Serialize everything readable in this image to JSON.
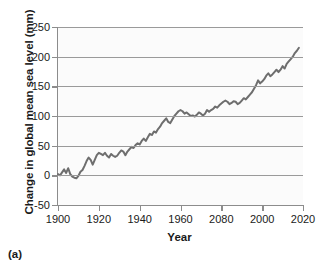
{
  "figure": {
    "caption": "(a)"
  },
  "chart_data": {
    "type": "line",
    "title": "",
    "xlabel": "Year",
    "ylabel": "Change in global mean sea level (mm)",
    "xlim": [
      1900,
      2020
    ],
    "ylim": [
      -50,
      250
    ],
    "xticks": [
      1900,
      1920,
      1940,
      1960,
      2080,
      2000,
      2020
    ],
    "xtick_positions": [
      1900,
      1920,
      1940,
      1960,
      1980,
      2000,
      2020
    ],
    "yticks": [
      250,
      200,
      150,
      100,
      50,
      0,
      -50
    ],
    "grid": "horizontal",
    "legend": "none",
    "line_color": "#6e6e6e",
    "line_width": 2.0,
    "zero_reference_line": {
      "value": 0,
      "style": "dashed",
      "color": "#9a9a9a"
    },
    "series": [
      {
        "name": "Change in global mean sea level",
        "units": "mm",
        "x": [
          1900,
          1901,
          1902,
          1903,
          1904,
          1905,
          1906,
          1907,
          1908,
          1909,
          1910,
          1911,
          1912,
          1913,
          1914,
          1915,
          1916,
          1917,
          1918,
          1919,
          1920,
          1921,
          1922,
          1923,
          1924,
          1925,
          1926,
          1927,
          1928,
          1929,
          1930,
          1931,
          1932,
          1933,
          1934,
          1935,
          1936,
          1937,
          1938,
          1939,
          1940,
          1941,
          1942,
          1943,
          1944,
          1945,
          1946,
          1947,
          1948,
          1949,
          1950,
          1951,
          1952,
          1953,
          1954,
          1955,
          1956,
          1957,
          1958,
          1959,
          1960,
          1961,
          1962,
          1963,
          1964,
          1965,
          1966,
          1967,
          1968,
          1969,
          1970,
          1971,
          1972,
          1973,
          1974,
          1975,
          1976,
          1977,
          1978,
          1979,
          1980,
          1981,
          1982,
          1983,
          1984,
          1985,
          1986,
          1987,
          1988,
          1989,
          1990,
          1991,
          1992,
          1993,
          1994,
          1995,
          1996,
          1997,
          1998,
          1999,
          2000,
          2001,
          2002,
          2003,
          2004,
          2005,
          2006,
          2007,
          2008,
          2009,
          2010,
          2011,
          2012,
          2013,
          2014,
          2015,
          2016,
          2017,
          2018
        ],
        "values": [
          2,
          0,
          5,
          10,
          4,
          12,
          2,
          -2,
          -4,
          -5,
          -1,
          6,
          9,
          16,
          24,
          30,
          26,
          18,
          26,
          34,
          38,
          36,
          34,
          38,
          33,
          30,
          36,
          33,
          31,
          33,
          38,
          42,
          40,
          34,
          40,
          44,
          48,
          46,
          51,
          54,
          52,
          58,
          62,
          58,
          64,
          70,
          68,
          74,
          72,
          78,
          82,
          88,
          92,
          96,
          90,
          88,
          94,
          100,
          104,
          108,
          110,
          108,
          104,
          106,
          103,
          100,
          101,
          99,
          102,
          106,
          104,
          101,
          104,
          110,
          107,
          110,
          112,
          116,
          114,
          118,
          121,
          124,
          126,
          124,
          120,
          122,
          125,
          124,
          120,
          122,
          126,
          130,
          128,
          132,
          136,
          140,
          146,
          152,
          160,
          155,
          158,
          162,
          168,
          172,
          167,
          170,
          174,
          178,
          174,
          178,
          184,
          180,
          188,
          192,
          196,
          200,
          206,
          210,
          215
        ]
      }
    ]
  }
}
